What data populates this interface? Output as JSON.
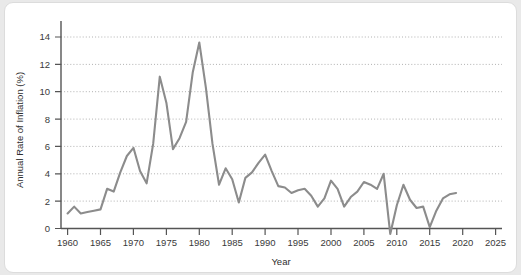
{
  "chart_data": {
    "type": "line",
    "title": "",
    "subtitle": "",
    "xlabel": "Year",
    "ylabel": "Annual Rate of Inflation (%)",
    "xlim": [
      1959,
      2026
    ],
    "ylim": [
      -0.9,
      15.0
    ],
    "grid": "horizontal-dotted",
    "legend": "none",
    "line_color": "#8c8c8c",
    "xticks": [
      1960,
      1965,
      1970,
      1975,
      1980,
      1985,
      1990,
      1995,
      2000,
      2005,
      2010,
      2015,
      2020,
      2025
    ],
    "yticks": [
      0,
      2,
      4,
      6,
      8,
      10,
      12,
      14
    ],
    "series": [
      {
        "name": "Annual Rate of Inflation",
        "x": [
          1960,
          1961,
          1962,
          1963,
          1964,
          1965,
          1966,
          1967,
          1968,
          1969,
          1970,
          1971,
          1972,
          1973,
          1974,
          1975,
          1976,
          1977,
          1978,
          1979,
          1980,
          1981,
          1982,
          1983,
          1984,
          1985,
          1986,
          1987,
          1988,
          1989,
          1990,
          1991,
          1992,
          1993,
          1994,
          1995,
          1996,
          1997,
          1998,
          1999,
          2000,
          2001,
          2002,
          2003,
          2004,
          2005,
          2006,
          2007,
          2008,
          2009,
          2010,
          2011,
          2012,
          2013,
          2014,
          2015,
          2016,
          2017,
          2018,
          2019
        ],
        "values": [
          1.1,
          1.6,
          1.1,
          1.2,
          1.3,
          1.4,
          2.9,
          2.7,
          4.1,
          5.3,
          5.9,
          4.2,
          3.3,
          6.2,
          11.1,
          9.2,
          5.8,
          6.6,
          7.8,
          11.4,
          13.6,
          10.3,
          6.2,
          3.2,
          4.4,
          3.6,
          1.9,
          3.7,
          4.1,
          4.8,
          5.4,
          4.2,
          3.1,
          3.0,
          2.6,
          2.8,
          2.9,
          2.4,
          1.6,
          2.2,
          3.5,
          2.9,
          1.6,
          2.3,
          2.7,
          3.4,
          3.2,
          2.9,
          4.0,
          -0.4,
          1.7,
          3.2,
          2.1,
          1.5,
          1.6,
          0.1,
          1.3,
          2.2,
          2.5,
          2.6
        ]
      }
    ]
  }
}
